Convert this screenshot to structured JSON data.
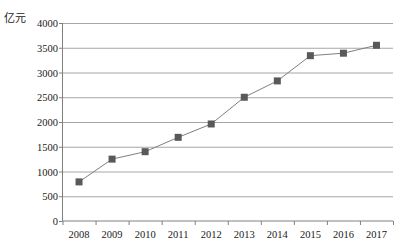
{
  "chart_data": {
    "type": "line",
    "title": "",
    "subtitle": "",
    "xlabel": "",
    "ylabel": "亿元",
    "unit_caption": "亿元",
    "categories": [
      "2008",
      "2009",
      "2010",
      "2011",
      "2012",
      "2013",
      "2014",
      "2015",
      "2016",
      "2017"
    ],
    "values": [
      790,
      1250,
      1400,
      1690,
      1960,
      2500,
      2830,
      3340,
      3390,
      3550
    ],
    "series": [
      {
        "name": "",
        "values": [
          790,
          1250,
          1400,
          1690,
          1960,
          2500,
          2830,
          3340,
          3390,
          3550
        ]
      }
    ],
    "ylim": [
      0,
      4000
    ],
    "ytick_step": 500,
    "yticks": [
      "0",
      "500",
      "1000",
      "1500",
      "2000",
      "2500",
      "3000",
      "3500",
      "4000"
    ],
    "ytick_values": [
      0,
      500,
      1000,
      1500,
      2000,
      2500,
      3000,
      3500,
      4000
    ],
    "grid": "horizontal",
    "legend": "none",
    "marker": "square",
    "colors": {
      "marker": "#595959",
      "line": "#7f7f7f",
      "grid": "#a6a6a6",
      "axis": "#808080",
      "text": "#1a1a1a",
      "background": "#ffffff"
    }
  }
}
